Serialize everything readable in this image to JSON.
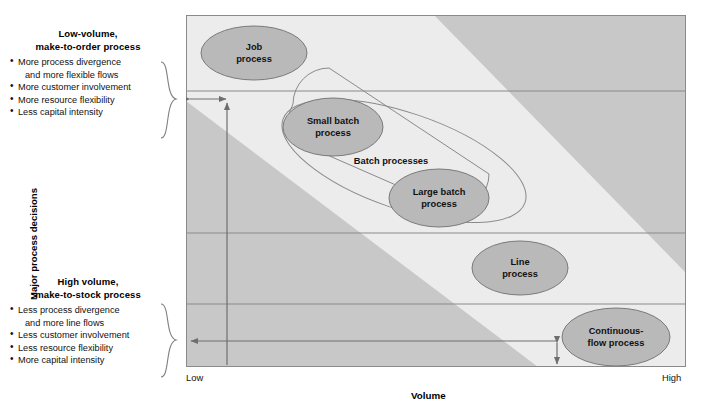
{
  "figure": {
    "y_axis_label": "Major process decisions",
    "x_axis_label": "Volume",
    "x_tick_low": "Low",
    "x_tick_high": "High"
  },
  "top_block": {
    "title_line1": "Low-volume,",
    "title_line2": "make-to-order process",
    "bullets": [
      "More process divergence",
      "and more flexible flows",
      "More customer involvement",
      "More resource flexibility",
      "Less capital intensity"
    ]
  },
  "bottom_block": {
    "title_line1": "High volume,",
    "title_line2": "make-to-stock process",
    "bullets": [
      "Less process divergence",
      "and more line flows",
      "Less customer involvement",
      "Less resource flexibility",
      "More capital intensity"
    ]
  },
  "nodes": {
    "job": {
      "line1": "Job",
      "line2": "process"
    },
    "small_batch": {
      "line1": "Small batch",
      "line2": "process"
    },
    "large_batch": {
      "line1": "Large batch",
      "line2": "process"
    },
    "line": {
      "line1": "Line",
      "line2": "process"
    },
    "continuous": {
      "line1": "Continuous-",
      "line2": "flow process"
    },
    "batch_group": {
      "label": "Batch processes"
    }
  },
  "colors": {
    "band_light": "#ececec",
    "band_dark": "#c8c8c8",
    "node_fill": "#b9b9b9",
    "node_stroke": "#7a7a7a",
    "divider": "#8a8a8a",
    "border": "#8a8a8a",
    "arrow": "#6e6e6e",
    "brace": "#7d7d7d"
  },
  "chart_data": {
    "type": "scatter",
    "title": "",
    "xlabel": "Volume",
    "ylabel": "Major process decisions",
    "xlim": [
      "Low",
      "High"
    ],
    "grid": "horizontal-band-dividers",
    "legend": "none",
    "bands": [
      {
        "name": "row-1",
        "y_top": 15,
        "y_bottom": 91
      },
      {
        "name": "row-2",
        "y_top": 91,
        "y_bottom": 233
      },
      {
        "name": "row-3",
        "y_top": 233,
        "y_bottom": 304
      },
      {
        "name": "row-4",
        "y_top": 304,
        "y_bottom": 366
      }
    ],
    "points": [
      {
        "label": "Job process",
        "volume": "very low",
        "row": 1
      },
      {
        "label": "Small batch process",
        "volume": "low",
        "row": 2
      },
      {
        "label": "Large batch process",
        "volume": "medium",
        "row": 2
      },
      {
        "label": "Line process",
        "volume": "high",
        "row": 3
      },
      {
        "label": "Continuous-flow process",
        "volume": "very high",
        "row": 4
      }
    ],
    "groups": [
      {
        "label": "Batch processes",
        "members": [
          "Small batch process",
          "Large batch process"
        ]
      }
    ],
    "annotations": [
      "Low-volume, make-to-order process",
      "High volume, make-to-stock process"
    ]
  }
}
